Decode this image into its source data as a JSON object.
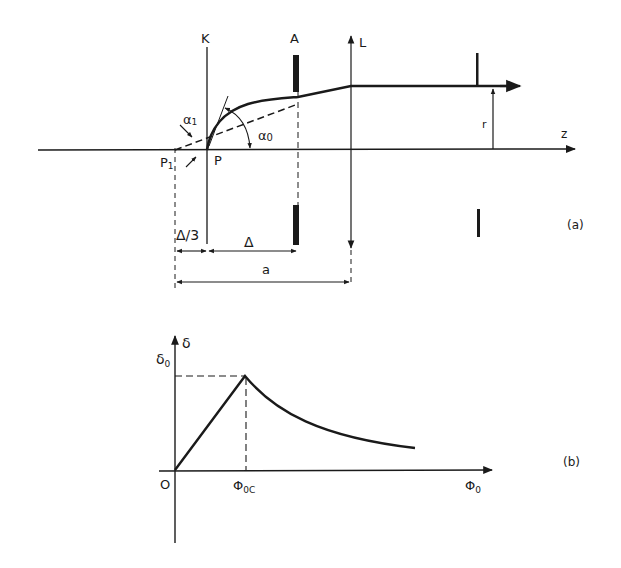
{
  "figure_a": {
    "label": "(a)",
    "axis_label_z": "z",
    "plane_K": "K",
    "aperture_A": "A",
    "lens_L": "L",
    "point_P": "P",
    "point_P1": "P",
    "point_P1_sub": "1",
    "angle_alpha1": "α",
    "angle_alpha1_sub": "1",
    "angle_alpha0": "α",
    "angle_alpha0_sub": "0",
    "radius_r": "r",
    "dim_delta_third": "Δ/3",
    "dim_delta": "Δ",
    "dim_a": "a"
  },
  "figure_b": {
    "label": "(b)",
    "y_axis_label": "δ",
    "y_peak_label": "δ",
    "y_peak_label_sub": "0",
    "origin_label": "O",
    "x_crit_label": "Φ",
    "x_crit_label_sub": "0C",
    "x_axis_label": "Φ",
    "x_axis_label_sub": "0"
  },
  "colors": {
    "ink": "#1a1a1a",
    "background": "#ffffff"
  }
}
